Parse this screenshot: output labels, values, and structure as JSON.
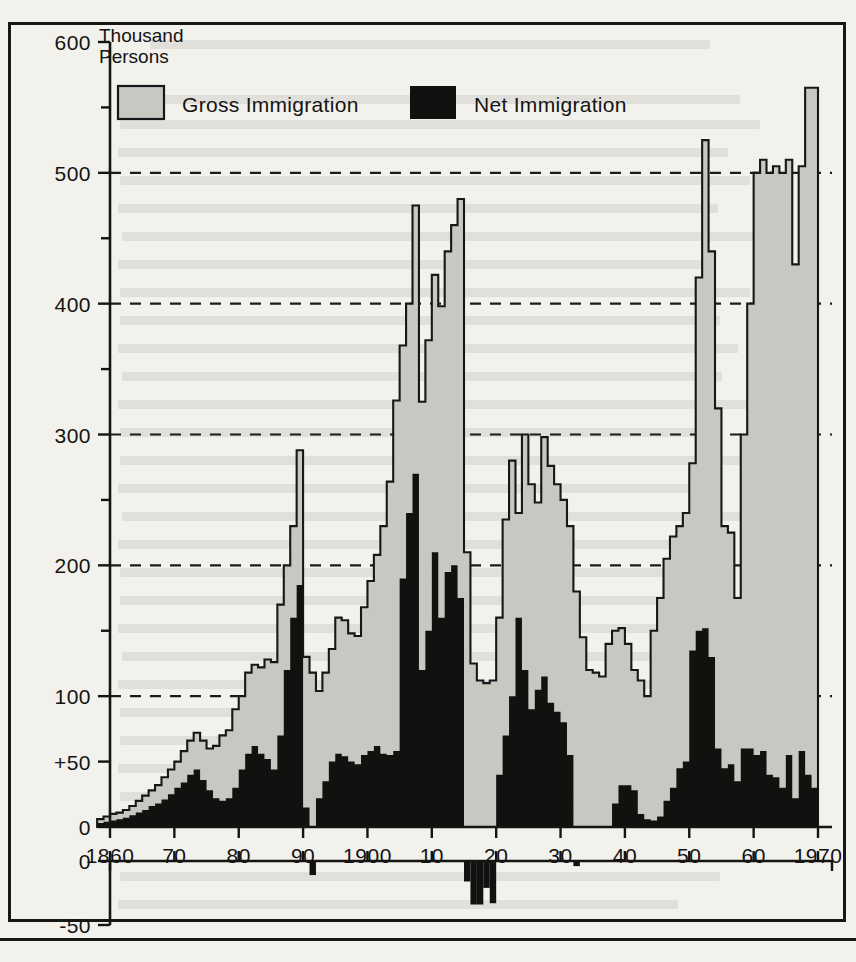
{
  "figure": {
    "unit_label_line1": "Thousand",
    "unit_label_line2": "Persons"
  },
  "legend": {
    "items": [
      {
        "label": "Gross Immigration",
        "color": "#c9c7c2",
        "swatch": "gross-swatch"
      },
      {
        "label": "Net Immigration",
        "color": "#111110",
        "swatch": "net-swatch"
      }
    ]
  },
  "axes": {
    "y_tick_labels": [
      "600",
      "500",
      "400",
      "300",
      "200",
      "100",
      "+50",
      "0"
    ],
    "y_minor_ticks": [
      550,
      450,
      350,
      250,
      150
    ],
    "y_negative_tick_labels": [
      "0",
      "-50"
    ],
    "x_tick_labels": [
      "1860",
      "70",
      "80",
      "90",
      "1900",
      "10",
      "20",
      "30",
      "40",
      "50",
      "60",
      "1970"
    ],
    "x_tick_years": [
      1860,
      1870,
      1880,
      1890,
      1900,
      1910,
      1920,
      1930,
      1940,
      1950,
      1960,
      1970
    ],
    "gridline_values": [
      500,
      400,
      300,
      200,
      100
    ]
  },
  "chart_data": {
    "type": "area",
    "title": "",
    "xlabel": "",
    "ylabel": "Thousand Persons",
    "ylim": [
      0,
      600
    ],
    "ylim_negative": [
      -50,
      0
    ],
    "xlim": [
      1858,
      1970
    ],
    "grid": true,
    "legend_position": "top-inside",
    "x": [
      1858,
      1859,
      1860,
      1861,
      1862,
      1863,
      1864,
      1865,
      1866,
      1867,
      1868,
      1869,
      1870,
      1871,
      1872,
      1873,
      1874,
      1875,
      1876,
      1877,
      1878,
      1879,
      1880,
      1881,
      1882,
      1883,
      1884,
      1885,
      1886,
      1887,
      1888,
      1889,
      1890,
      1891,
      1892,
      1893,
      1894,
      1895,
      1896,
      1897,
      1898,
      1899,
      1900,
      1901,
      1902,
      1903,
      1904,
      1905,
      1906,
      1907,
      1908,
      1909,
      1910,
      1911,
      1912,
      1913,
      1914,
      1915,
      1916,
      1917,
      1918,
      1919,
      1920,
      1921,
      1922,
      1923,
      1924,
      1925,
      1926,
      1927,
      1928,
      1929,
      1930,
      1931,
      1932,
      1933,
      1934,
      1935,
      1936,
      1937,
      1938,
      1939,
      1940,
      1941,
      1942,
      1943,
      1944,
      1945,
      1946,
      1947,
      1948,
      1949,
      1950,
      1951,
      1952,
      1953,
      1954,
      1955,
      1956,
      1957,
      1958,
      1959,
      1960,
      1961,
      1962,
      1963,
      1964,
      1965,
      1966,
      1967,
      1968,
      1969
    ],
    "series": [
      {
        "name": "Gross Immigration",
        "color": "#c9c7c2",
        "values": [
          6,
          8,
          10,
          11,
          13,
          16,
          20,
          24,
          28,
          32,
          38,
          44,
          50,
          58,
          66,
          72,
          66,
          60,
          62,
          70,
          74,
          90,
          100,
          118,
          124,
          122,
          128,
          126,
          170,
          200,
          230,
          288,
          130,
          118,
          104,
          118,
          136,
          160,
          158,
          148,
          146,
          168,
          188,
          208,
          230,
          264,
          326,
          368,
          400,
          475,
          325,
          372,
          422,
          398,
          440,
          460,
          480,
          210,
          125,
          112,
          110,
          112,
          160,
          235,
          280,
          240,
          300,
          262,
          248,
          298,
          276,
          262,
          250,
          230,
          180,
          145,
          120,
          118,
          115,
          140,
          150,
          152,
          140,
          120,
          112,
          100,
          150,
          175,
          205,
          222,
          230,
          240,
          278,
          420,
          525,
          440,
          320,
          230,
          225,
          175,
          300,
          400,
          500,
          510,
          500,
          505,
          500,
          510,
          430,
          505,
          565,
          565
        ]
      },
      {
        "name": "Net Immigration",
        "color": "#111110",
        "values": [
          3,
          4,
          5,
          6,
          7,
          9,
          11,
          13,
          16,
          18,
          21,
          25,
          30,
          34,
          40,
          44,
          36,
          28,
          22,
          20,
          22,
          30,
          44,
          56,
          62,
          56,
          52,
          44,
          70,
          120,
          160,
          185,
          15,
          0,
          22,
          35,
          50,
          56,
          54,
          50,
          48,
          55,
          58,
          62,
          56,
          55,
          58,
          190,
          240,
          270,
          120,
          150,
          210,
          160,
          195,
          200,
          175,
          0,
          0,
          0,
          0,
          0,
          40,
          70,
          100,
          160,
          120,
          90,
          105,
          115,
          95,
          88,
          80,
          55,
          0,
          0,
          0,
          0,
          0,
          0,
          18,
          32,
          32,
          28,
          10,
          6,
          5,
          8,
          20,
          30,
          45,
          50,
          135,
          150,
          152,
          130,
          60,
          45,
          48,
          35,
          60,
          60,
          55,
          58,
          40,
          38,
          30,
          55,
          22,
          58,
          40,
          30
        ]
      },
      {
        "name": "Net Emigration (negative)",
        "color": "#111110",
        "negative": true,
        "points": [
          {
            "year": 1891,
            "value": -11
          },
          {
            "year": 1915,
            "value": -16
          },
          {
            "year": 1916,
            "value": -34
          },
          {
            "year": 1917,
            "value": -34
          },
          {
            "year": 1918,
            "value": -21
          },
          {
            "year": 1919,
            "value": -33
          },
          {
            "year": 1932,
            "value": -4
          }
        ]
      }
    ]
  }
}
